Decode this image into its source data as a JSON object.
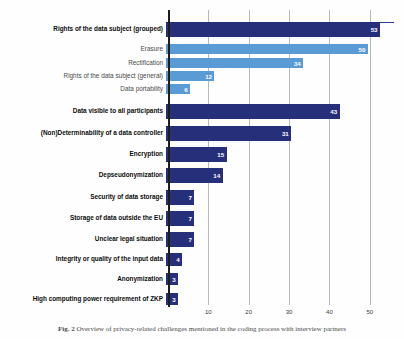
{
  "chart_data": {
    "type": "bar",
    "orientation": "horizontal",
    "title": "",
    "xlabel": "",
    "ylabel": "",
    "xlim": [
      0,
      56
    ],
    "grid": true,
    "gridlines": [
      10,
      20,
      30,
      40,
      50
    ],
    "tick_labels": [
      "10",
      "20",
      "30",
      "40",
      "50"
    ],
    "legend": null,
    "colors": {
      "primary": "#26307a",
      "secondary": "#5b9bd5",
      "gridline": "#b8b8b8",
      "axis": "#1d1d1d",
      "value_label": "#ffffff"
    },
    "categories": [
      "Rights of the data subject (grouped)",
      "Erasure",
      "Rectification",
      "Rights of the data subject (general)",
      "Data portability",
      "Data visible to all participants",
      "(Non)Determinability of a data controller",
      "Encryption",
      "Depseudonymization",
      "Security of data storage",
      "Storage of data outside the EU",
      "Unclear legal situation",
      "Integrity or quality of the input data",
      "Anonymization",
      "High computing power requirement of ZKP"
    ],
    "values": [
      53,
      50,
      34,
      12,
      6,
      43,
      31,
      15,
      14,
      7,
      7,
      7,
      4,
      3,
      3
    ],
    "bars": [
      {
        "label": "Rights of the data subject (grouped)",
        "value": 53,
        "style": "main"
      },
      {
        "label": "Erasure",
        "value": 50,
        "style": "sub"
      },
      {
        "label": "Rectification",
        "value": 34,
        "style": "sub"
      },
      {
        "label": "Rights of the data subject (general)",
        "value": 12,
        "style": "sub"
      },
      {
        "label": "Data portability",
        "value": 6,
        "style": "sub"
      },
      {
        "label": "Data visible to all participants",
        "value": 43,
        "style": "main"
      },
      {
        "label": "(Non)Determinability of a data controller",
        "value": 31,
        "style": "main"
      },
      {
        "label": "Encryption",
        "value": 15,
        "style": "main"
      },
      {
        "label": "Depseudonymization",
        "value": 14,
        "style": "main"
      },
      {
        "label": "Security of data storage",
        "value": 7,
        "style": "main"
      },
      {
        "label": "Storage of data outside the EU",
        "value": 7,
        "style": "main"
      },
      {
        "label": "Unclear legal situation",
        "value": 7,
        "style": "main"
      },
      {
        "label": "Integrity or quality of the input data",
        "value": 4,
        "style": "main"
      },
      {
        "label": "Anonymization",
        "value": 3,
        "style": "main"
      },
      {
        "label": "High computing power requirement of ZKP",
        "value": 3,
        "style": "main"
      }
    ]
  },
  "caption": {
    "figure_number": "Fig. 2",
    "text": "Overview of privacy-related challenges mentioned in the coding process with interview partners"
  }
}
